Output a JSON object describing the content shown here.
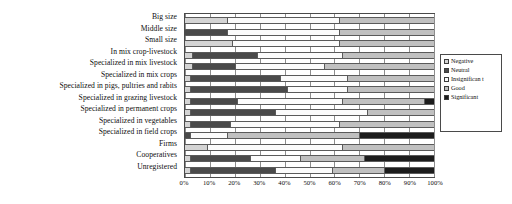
{
  "chart_data": {
    "type": "bar",
    "orientation": "horizontal",
    "stacked": true,
    "title": "",
    "xlabel": "",
    "ylabel": "",
    "xlim": [
      0,
      100
    ],
    "grid": true,
    "legend_position": "right",
    "xticks": [
      "0%",
      "10%",
      "20%",
      "30%",
      "40%",
      "50%",
      "60%",
      "70%",
      "80%",
      "90%",
      "100%"
    ],
    "xtick_values": [
      0,
      10,
      20,
      30,
      40,
      50,
      60,
      70,
      80,
      90,
      100
    ],
    "categories": [
      "Big size",
      "Middle size",
      "Small size",
      "In mix crop-livestock",
      "Specialized in mix livestock",
      "Specialized in mix crops",
      "Specialized in pigs, pultries and rabits",
      "Specialized in grazing livestock",
      "Specialized in permanent crops",
      "Specialized in vegetables",
      "Specialized in field crops",
      "Firms",
      "Cooperatives",
      "Unregistered"
    ],
    "series": [
      {
        "name": "Negative",
        "color": "#d4d4d4",
        "values": [
          17,
          0,
          19,
          3,
          3,
          2,
          2,
          2,
          2,
          2,
          0,
          9,
          2,
          2
        ]
      },
      {
        "name": "Neutral",
        "color": "#4a4a4a",
        "values": [
          0,
          17,
          0,
          26,
          17,
          36,
          39,
          19,
          34,
          16,
          2,
          0,
          24,
          34
        ]
      },
      {
        "name": "Insignificant",
        "color": "#fbfbfb",
        "values": [
          45,
          45,
          43,
          34,
          36,
          27,
          24,
          42,
          37,
          44,
          15,
          54,
          20,
          23
        ]
      },
      {
        "name": "Good",
        "color": "#c0c0c0",
        "values": [
          38,
          38,
          38,
          37,
          44,
          35,
          35,
          33,
          27,
          38,
          53,
          37,
          26,
          21
        ]
      },
      {
        "name": "Significant",
        "color": "#1c1c1c",
        "values": [
          0,
          0,
          0,
          0,
          0,
          0,
          0,
          4,
          0,
          0,
          30,
          0,
          28,
          20
        ]
      }
    ]
  },
  "legend": {
    "items": [
      {
        "label": "Negative",
        "swatch": "legend-swatch-negative"
      },
      {
        "label": "Neutral",
        "swatch": "legend-swatch-neutral"
      },
      {
        "label": "Insignifican t",
        "swatch": "legend-swatch-insignificant"
      },
      {
        "label": "Good",
        "swatch": "legend-swatch-good"
      },
      {
        "label": "Significant",
        "swatch": "legend-swatch-significant"
      }
    ]
  },
  "caption": ""
}
